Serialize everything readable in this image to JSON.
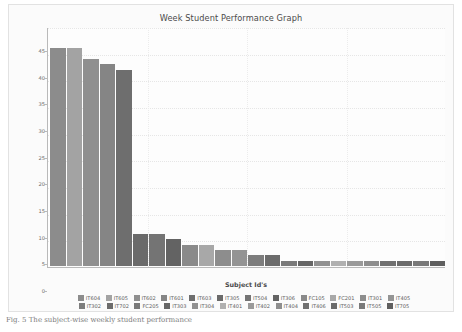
{
  "figure": {
    "caption": "Fig. 5  The subject-wise weekly student performance"
  },
  "chart_data": {
    "type": "bar",
    "title": "Week Student Performance Graph",
    "xlabel": "Subject Id's",
    "ylabel": "Number of Student's",
    "ylim": [
      0,
      45
    ],
    "yticks": [
      0,
      5,
      10,
      15,
      20,
      25,
      30,
      35,
      40,
      45
    ],
    "grid": true,
    "legend_position": "bottom",
    "categories": [
      "IT604",
      "IT605",
      "IT602",
      "IT601",
      "IT603",
      "IT305",
      "IT504",
      "IT306",
      "FC105",
      "FC201",
      "IT301",
      "IT405",
      "IT302",
      "IT702",
      "FC205",
      "IT303",
      "IT304",
      "IT401",
      "IT402",
      "IT404",
      "IT406",
      "IT503",
      "IT505",
      "IT705"
    ],
    "values": [
      41,
      41,
      39,
      38,
      37,
      6,
      6,
      5,
      4,
      4,
      3,
      3,
      2,
      2,
      1,
      1,
      1,
      1,
      1,
      1,
      1,
      1,
      1,
      1
    ],
    "colors": [
      "#8c8c8c",
      "#a3a3a3",
      "#8f8f8f",
      "#858585",
      "#6e6e6e",
      "#6a6a6a",
      "#747474",
      "#636363",
      "#8a8a8a",
      "#a8a8a8",
      "#8d8d8d",
      "#949494",
      "#7d7d7d",
      "#6c6c6c",
      "#7a7a7a",
      "#666666",
      "#919191",
      "#b0b0b0",
      "#9a9a9a",
      "#8e8e8e",
      "#707070",
      "#6b6b6b",
      "#797979",
      "#5f5f5f"
    ]
  },
  "legend": {
    "row1": [
      {
        "label": "IT604",
        "color": "#8c8c8c"
      },
      {
        "label": "IT605",
        "color": "#a3a3a3"
      },
      {
        "label": "IT602",
        "color": "#8f8f8f"
      },
      {
        "label": "IT601",
        "color": "#858585"
      },
      {
        "label": "IT603",
        "color": "#6e6e6e"
      },
      {
        "label": "IT305",
        "color": "#6a6a6a"
      },
      {
        "label": "IT504",
        "color": "#747474"
      },
      {
        "label": "IT306",
        "color": "#636363"
      },
      {
        "label": "FC105",
        "color": "#8a8a8a"
      },
      {
        "label": "FC201",
        "color": "#a8a8a8"
      },
      {
        "label": "IT301",
        "color": "#8d8d8d"
      },
      {
        "label": "IT405",
        "color": "#949494"
      }
    ],
    "row2": [
      {
        "label": "IT302",
        "color": "#7d7d7d"
      },
      {
        "label": "IT702",
        "color": "#6c6c6c"
      },
      {
        "label": "FC205",
        "color": "#7a7a7a"
      },
      {
        "label": "IT303",
        "color": "#666666"
      },
      {
        "label": "IT304",
        "color": "#919191"
      },
      {
        "label": "IT401",
        "color": "#b0b0b0"
      },
      {
        "label": "IT402",
        "color": "#9a9a9a"
      },
      {
        "label": "IT404",
        "color": "#8e8e8e"
      },
      {
        "label": "IT406",
        "color": "#707070"
      },
      {
        "label": "IT503",
        "color": "#6b6b6b"
      },
      {
        "label": "IT505",
        "color": "#797979"
      },
      {
        "label": "IT705",
        "color": "#5f5f5f"
      }
    ]
  }
}
